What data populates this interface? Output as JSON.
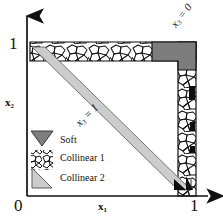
{
  "figure": {
    "name": "phase-diagram-collinear-soft",
    "axes": {
      "x": {
        "label": "x",
        "sub": "1",
        "ticks": [
          "0",
          "1"
        ]
      },
      "y": {
        "label": "x",
        "sub": "2",
        "ticks": [
          "1"
        ]
      },
      "origin_label": "0"
    },
    "annotations": [
      {
        "id": "x3-eq-0",
        "text": "x",
        "sub": "3",
        "eq": " = 0",
        "rotation": -52
      },
      {
        "id": "x3-eq-1",
        "text": "x",
        "sub": "3",
        "eq": " = 1",
        "rotation": -45
      }
    ],
    "legend": {
      "items": [
        {
          "id": "soft",
          "label": "Soft",
          "swatch": "inverted-triangle",
          "color": "#7d7d7d"
        },
        {
          "id": "collinear-1",
          "label": "Collinear 1",
          "swatch": "cellular-pattern",
          "color": "#ffffff"
        },
        {
          "id": "collinear-2",
          "label": "Collinear 2",
          "swatch": "right-triangle",
          "color": "#c9c9c9"
        }
      ]
    },
    "colors": {
      "soft": "#7d7d7d",
      "collinear2": "#cccccc",
      "collinear1_fill": "#ffffff",
      "cell_stroke": "#111111",
      "axis": "#111111",
      "black_marker": "#0d0d0d"
    },
    "regions": [
      {
        "id": "collinear-1-top",
        "type": "cellular-band",
        "edge": "top"
      },
      {
        "id": "collinear-1-right",
        "type": "cellular-band",
        "edge": "right"
      },
      {
        "id": "collinear-2-diagonal",
        "type": "gray-band",
        "edge": "diagonal"
      },
      {
        "id": "soft-corner",
        "type": "solid-block",
        "edge": "top-right"
      },
      {
        "id": "soft-marker-right",
        "type": "solid-block",
        "edge": "right"
      },
      {
        "id": "soft-marker-bottom",
        "type": "solid-triangle",
        "edge": "bottom-right"
      }
    ]
  }
}
